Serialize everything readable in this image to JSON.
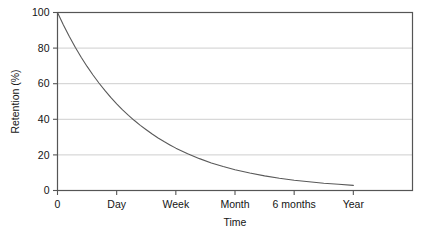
{
  "chart_data": {
    "type": "line",
    "title": "",
    "xlabel": "Time",
    "ylabel": "Retention (%)",
    "grid": "horizontal",
    "legend": "none",
    "xlim": [
      0,
      6
    ],
    "ylim": [
      0,
      100
    ],
    "x_tick_labels": [
      "0",
      "Day",
      "Week",
      "Month",
      "6 months",
      "Year"
    ],
    "x_tick_positions": [
      0,
      1,
      2,
      3,
      4,
      5
    ],
    "y_tick_labels": [
      "0",
      "20",
      "40",
      "60",
      "80",
      "100"
    ],
    "y_tick_values": [
      0,
      20,
      40,
      60,
      80,
      100
    ],
    "series": [
      {
        "name": "Retention",
        "color": "#595959",
        "x": [
          0.0,
          0.1,
          0.2,
          0.3,
          0.4,
          0.5,
          0.6,
          0.7,
          0.8,
          0.9,
          1.0,
          1.1,
          1.2,
          1.3,
          1.4,
          1.5,
          1.6,
          1.7,
          1.8,
          1.9,
          2.0,
          2.2,
          2.4,
          2.6,
          2.8,
          3.0,
          3.25,
          3.5,
          3.75,
          4.0,
          4.25,
          4.5,
          4.75,
          5.0
        ],
        "values": [
          100.0,
          93.0,
          86.5,
          80.5,
          74.9,
          69.7,
          64.9,
          60.4,
          56.2,
          52.3,
          48.7,
          45.3,
          42.2,
          39.3,
          36.6,
          34.1,
          31.7,
          29.5,
          27.5,
          25.6,
          23.8,
          20.7,
          17.9,
          15.5,
          13.5,
          11.7,
          9.8,
          8.2,
          6.9,
          5.8,
          4.9,
          4.1,
          3.5,
          2.9
        ]
      }
    ],
    "annotations": []
  },
  "axis": {
    "y_title": "Retention (%)",
    "x_title": "Time",
    "y_labels": [
      "100",
      "80",
      "60",
      "40",
      "20",
      "0"
    ],
    "x_labels": [
      "0",
      "Day",
      "Week",
      "Month",
      "6 months",
      "Year"
    ]
  },
  "colors": {
    "curve": "#595959",
    "grid": "#c8c8c8",
    "frame": "#555555",
    "text": "#141414",
    "background": "#ffffff"
  }
}
